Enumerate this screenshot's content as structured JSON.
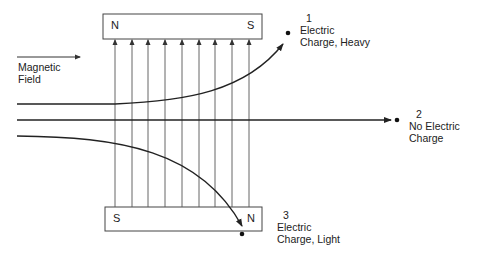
{
  "diagram": {
    "magnetic_field_label": [
      "Magnetic",
      "Field"
    ],
    "top_magnet": {
      "left_pole": "N",
      "right_pole": "S"
    },
    "bottom_magnet": {
      "left_pole": "S",
      "right_pole": "N"
    },
    "field_line_count": 9,
    "paths": [
      {
        "number": "1",
        "label_line1": "Electric",
        "label_line2": "Charge, Heavy"
      },
      {
        "number": "2",
        "label_line1": "No Electric",
        "label_line2": "Charge"
      },
      {
        "number": "3",
        "label_line1": "Electric",
        "label_line2": "Charge, Light"
      }
    ],
    "colors": {
      "line": "#333333",
      "field_line": "#555555",
      "box_border": "#444444"
    }
  }
}
